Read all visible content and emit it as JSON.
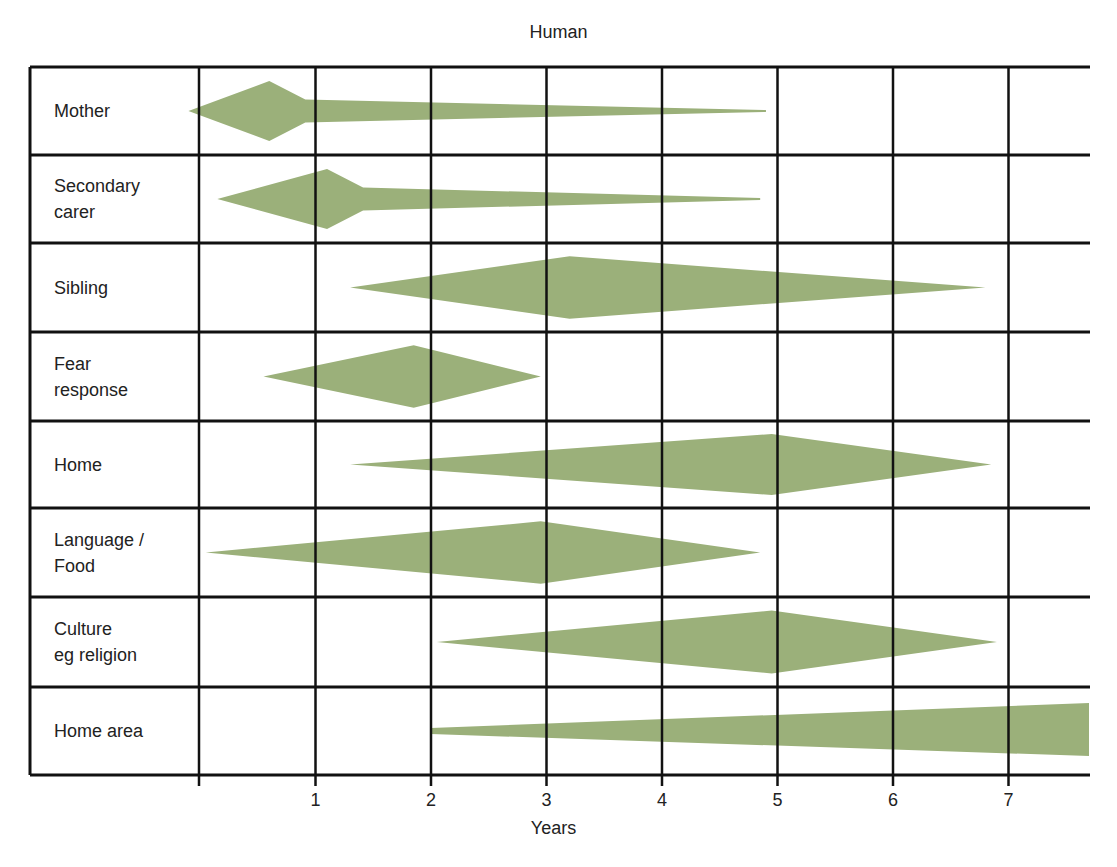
{
  "title": "Human",
  "x_axis": {
    "label": "Years",
    "ticks": [
      "1",
      "2",
      "3",
      "4",
      "5",
      "6",
      "7"
    ]
  },
  "colors": {
    "shape_fill": "#9bb07a",
    "grid_line": "#111111",
    "background": "#ffffff"
  },
  "rows": [
    {
      "label_lines": [
        "Mother"
      ],
      "shape": "spike-diamond",
      "start_year": -0.1,
      "peak_year": 0.6,
      "end_year": 4.9
    },
    {
      "label_lines": [
        "Secondary",
        "carer"
      ],
      "shape": "spike-diamond",
      "start_year": 0.15,
      "peak_year": 1.1,
      "end_year": 4.85
    },
    {
      "label_lines": [
        "Sibling"
      ],
      "shape": "diamond",
      "start_year": 1.3,
      "peak_year": 3.2,
      "end_year": 6.8
    },
    {
      "label_lines": [
        "Fear",
        "response"
      ],
      "shape": "diamond",
      "start_year": 0.55,
      "peak_year": 1.85,
      "end_year": 2.95
    },
    {
      "label_lines": [
        "Home"
      ],
      "shape": "diamond",
      "start_year": 1.3,
      "peak_year": 4.95,
      "end_year": 6.85
    },
    {
      "label_lines": [
        "Language /",
        "Food"
      ],
      "shape": "diamond",
      "start_year": 0.05,
      "peak_year": 2.95,
      "end_year": 4.85
    },
    {
      "label_lines": [
        "Culture",
        "eg religion"
      ],
      "shape": "diamond",
      "start_year": 2.05,
      "peak_year": 4.95,
      "end_year": 6.9
    },
    {
      "label_lines": [
        "Home area"
      ],
      "shape": "wedge",
      "start_year": 2.0,
      "peak_year": 7.7,
      "end_year": 7.7
    }
  ]
}
